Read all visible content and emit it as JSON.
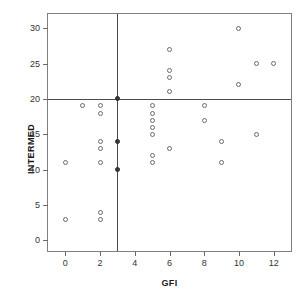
{
  "chart_data": {
    "type": "scatter",
    "title": "",
    "xlabel": "GFI",
    "ylabel": "INTERMED",
    "xlim": [
      -1,
      13
    ],
    "ylim": [
      -1.5,
      32
    ],
    "grid": false,
    "legend": null,
    "xticks": [
      0,
      2,
      4,
      6,
      8,
      10,
      12
    ],
    "xtick_labels": [
      "0",
      "2",
      "4",
      "6",
      "8",
      "10",
      "12"
    ],
    "yticks": [
      0,
      5,
      10,
      15,
      20,
      25,
      30
    ],
    "ytick_labels": [
      "0",
      "5",
      "10",
      "15",
      "20",
      "25",
      "30"
    ],
    "reference_lines": [
      {
        "axis": "x",
        "value": 3,
        "label": "GFI cutpoint"
      },
      {
        "axis": "y",
        "value": 20,
        "label": "INTERMED cutpoint"
      }
    ],
    "marker": "open-circle",
    "points": [
      {
        "x": 0,
        "y": 11,
        "filled": false
      },
      {
        "x": 0,
        "y": 3,
        "filled": false
      },
      {
        "x": 1,
        "y": 19,
        "filled": false
      },
      {
        "x": 2,
        "y": 19,
        "filled": false
      },
      {
        "x": 2,
        "y": 18,
        "filled": false
      },
      {
        "x": 2,
        "y": 14,
        "filled": false
      },
      {
        "x": 2,
        "y": 13,
        "filled": false
      },
      {
        "x": 2,
        "y": 11,
        "filled": false
      },
      {
        "x": 2,
        "y": 4,
        "filled": false
      },
      {
        "x": 2,
        "y": 3,
        "filled": false
      },
      {
        "x": 3,
        "y": 20,
        "filled": true
      },
      {
        "x": 3,
        "y": 14,
        "filled": true
      },
      {
        "x": 3,
        "y": 10,
        "filled": true
      },
      {
        "x": 5,
        "y": 19,
        "filled": false
      },
      {
        "x": 5,
        "y": 18,
        "filled": false
      },
      {
        "x": 5,
        "y": 17,
        "filled": false
      },
      {
        "x": 5,
        "y": 16,
        "filled": false
      },
      {
        "x": 5,
        "y": 15,
        "filled": false
      },
      {
        "x": 5,
        "y": 12,
        "filled": false
      },
      {
        "x": 5,
        "y": 11,
        "filled": false
      },
      {
        "x": 6,
        "y": 27,
        "filled": false
      },
      {
        "x": 6,
        "y": 24,
        "filled": false
      },
      {
        "x": 6,
        "y": 23,
        "filled": false
      },
      {
        "x": 6,
        "y": 21,
        "filled": false
      },
      {
        "x": 6,
        "y": 13,
        "filled": false
      },
      {
        "x": 8,
        "y": 19,
        "filled": false
      },
      {
        "x": 8,
        "y": 17,
        "filled": false
      },
      {
        "x": 9,
        "y": 14,
        "filled": false
      },
      {
        "x": 9,
        "y": 11,
        "filled": false
      },
      {
        "x": 10,
        "y": 30,
        "filled": false
      },
      {
        "x": 10,
        "y": 22,
        "filled": false
      },
      {
        "x": 11,
        "y": 25,
        "filled": false
      },
      {
        "x": 11,
        "y": 15,
        "filled": false
      },
      {
        "x": 12,
        "y": 25,
        "filled": false
      }
    ],
    "colors": {
      "marker_stroke": "#6a6a6a",
      "filled_marker": "#3a3a3a",
      "reference_line": "#4a4a4a",
      "frame": "#808080",
      "text": "#1a1a1a",
      "background": "#ffffff"
    }
  }
}
